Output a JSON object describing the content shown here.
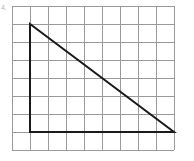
{
  "figure": {
    "label": "4.",
    "background_color": "#ffffff"
  },
  "grid": {
    "name": "square-grid",
    "origin_x": 12,
    "origin_y": 6,
    "cell_size": 18,
    "columns": 9,
    "rows": 8,
    "line_color": "#9a9a9a",
    "line_width": 1
  },
  "chart_data": {
    "type": "scatter",
    "xlabel": "",
    "ylabel": "",
    "grid": true,
    "legend": "none",
    "xlim": [
      0,
      9
    ],
    "ylim": [
      0,
      8
    ],
    "shapes": [
      {
        "name": "right-triangle",
        "type": "polygon",
        "closed": true,
        "stroke": "#1a1a1a",
        "stroke_width": 2,
        "fill": "none",
        "vertices_grid": [
          [
            1,
            6
          ],
          [
            1,
            0
          ],
          [
            9,
            0
          ]
        ],
        "vertices_px": [
          [
            30,
            24
          ],
          [
            30,
            132
          ],
          [
            174,
            132
          ]
        ],
        "edges": [
          {
            "name": "vertical-leg",
            "from_grid": [
              1,
              6
            ],
            "to_grid": [
              1,
              0
            ],
            "length_cells": 6
          },
          {
            "name": "horizontal-leg",
            "from_grid": [
              1,
              0
            ],
            "to_grid": [
              9,
              0
            ],
            "length_cells": 8
          },
          {
            "name": "hypotenuse",
            "from_grid": [
              9,
              0
            ],
            "to_grid": [
              1,
              6
            ],
            "length_cells": 10
          }
        ]
      }
    ]
  }
}
